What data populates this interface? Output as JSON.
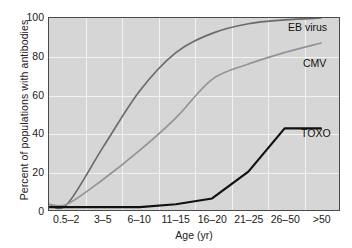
{
  "chart_data": {
    "type": "line",
    "title": "",
    "xlabel": "Age (yr)",
    "ylabel": "Percent of populations with antibodies",
    "categories": [
      "0.5–2",
      "3–5",
      "6–10",
      "11–15",
      "16–20",
      "21–25",
      "26–50",
      ">50"
    ],
    "ylim": [
      0,
      100
    ],
    "yticks": [
      0,
      20,
      40,
      60,
      80,
      100
    ],
    "grid": true,
    "legend_position": "inline-right",
    "series": [
      {
        "name": "EB virus",
        "color": "#6b6b6b",
        "values": [
          3,
          33,
          62,
          82,
          92,
          97,
          99,
          100
        ]
      },
      {
        "name": "CMV",
        "color": "#939393",
        "values": [
          3,
          16,
          31,
          48,
          68,
          76,
          82,
          87
        ]
      },
      {
        "name": "TOXO",
        "color": "#111111",
        "values": [
          1.5,
          1.5,
          1.5,
          3,
          6,
          20,
          42.5,
          42.5
        ]
      }
    ]
  },
  "axes": {
    "background": "#d6d6d6",
    "gridline_color": "#f2f2f2",
    "frame_color": "#4a4a4a"
  }
}
